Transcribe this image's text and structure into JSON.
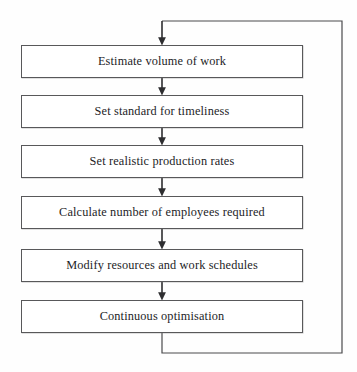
{
  "diagram": {
    "type": "flowchart",
    "orientation": "vertical",
    "colors": {
      "background": "#fefefe",
      "box_fill": "#ffffff",
      "box_stroke": "#58585a",
      "connector_stroke": "#3a3a3c",
      "text": "#1d1d1f"
    },
    "nodes": [
      {
        "id": "n1",
        "label": "Estimate volume of work",
        "x": 21,
        "y": 45,
        "w": 282,
        "h": 33
      },
      {
        "id": "n2",
        "label": "Set standard for timeliness",
        "x": 21,
        "y": 95,
        "w": 282,
        "h": 33
      },
      {
        "id": "n3",
        "label": "Set realistic production rates",
        "x": 21,
        "y": 145,
        "w": 282,
        "h": 33
      },
      {
        "id": "n4",
        "label": "Calculate number of employees required",
        "x": 21,
        "y": 196,
        "w": 282,
        "h": 33
      },
      {
        "id": "n5",
        "label": "Modify resources and work schedules",
        "x": 21,
        "y": 249,
        "w": 282,
        "h": 33
      },
      {
        "id": "n6",
        "label": "Continuous optimisation",
        "x": 21,
        "y": 300,
        "w": 282,
        "h": 33
      }
    ],
    "connectors": [
      {
        "id": "c0",
        "kind": "arrow-down",
        "from": "loop",
        "to": "n1",
        "x": 162,
        "y1": 21,
        "y2": 45
      },
      {
        "id": "c1",
        "kind": "arrow-down",
        "from": "n1",
        "to": "n2",
        "x": 162,
        "y1": 78,
        "y2": 95
      },
      {
        "id": "c2",
        "kind": "arrow-down",
        "from": "n2",
        "to": "n3",
        "x": 162,
        "y1": 128,
        "y2": 145
      },
      {
        "id": "c3",
        "kind": "arrow-down",
        "from": "n3",
        "to": "n4",
        "x": 162,
        "y1": 178,
        "y2": 196
      },
      {
        "id": "c4",
        "kind": "arrow-down",
        "from": "n4",
        "to": "n5",
        "x": 162,
        "y1": 229,
        "y2": 249
      },
      {
        "id": "c5",
        "kind": "arrow-down",
        "from": "n5",
        "to": "n6",
        "x": 162,
        "y1": 282,
        "y2": 300
      }
    ],
    "feedback_loop": {
      "id": "feedback",
      "label": "feedback loop from Continuous optimisation back to Estimate volume of work",
      "down_x": 162,
      "down_y1": 333,
      "bottom_y": 353,
      "right_x": 342,
      "top_y": 21,
      "arrow_target_x": 162
    }
  }
}
